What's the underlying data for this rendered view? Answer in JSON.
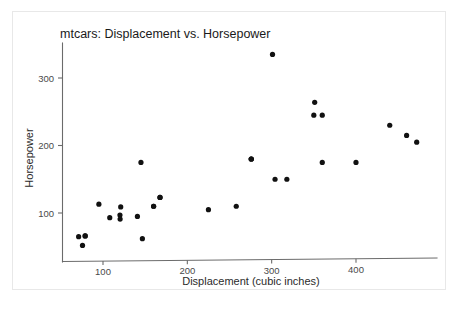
{
  "chart_data": {
    "type": "scatter",
    "title": "mtcars: Displacement vs. Horsepower",
    "xlabel": "Displacement (cubic inches)",
    "ylabel": "Horsepower",
    "xlim": [
      60,
      490
    ],
    "ylim": [
      45,
      350
    ],
    "xticks": [
      100,
      200,
      300,
      400
    ],
    "xtick_labels": [
      "100",
      "200",
      "300",
      "400"
    ],
    "yticks": [
      100,
      200,
      300
    ],
    "ytick_labels": [
      "100",
      "200",
      "300"
    ],
    "grid": false,
    "legend": null,
    "marker": "filled-circle",
    "marker_color": "#111111",
    "points": [
      {
        "x": 160.0,
        "y": 110
      },
      {
        "x": 160.0,
        "y": 110
      },
      {
        "x": 108.0,
        "y": 93
      },
      {
        "x": 258.0,
        "y": 110
      },
      {
        "x": 360.0,
        "y": 175
      },
      {
        "x": 225.0,
        "y": 105
      },
      {
        "x": 360.0,
        "y": 245
      },
      {
        "x": 146.7,
        "y": 62
      },
      {
        "x": 140.8,
        "y": 95
      },
      {
        "x": 167.6,
        "y": 123
      },
      {
        "x": 167.6,
        "y": 123
      },
      {
        "x": 275.8,
        "y": 180
      },
      {
        "x": 275.8,
        "y": 180
      },
      {
        "x": 275.8,
        "y": 180
      },
      {
        "x": 472.0,
        "y": 205
      },
      {
        "x": 460.0,
        "y": 215
      },
      {
        "x": 440.0,
        "y": 230
      },
      {
        "x": 78.7,
        "y": 66
      },
      {
        "x": 75.7,
        "y": 52
      },
      {
        "x": 71.1,
        "y": 65
      },
      {
        "x": 120.1,
        "y": 97
      },
      {
        "x": 318.0,
        "y": 150
      },
      {
        "x": 304.0,
        "y": 150
      },
      {
        "x": 350.0,
        "y": 245
      },
      {
        "x": 400.0,
        "y": 175
      },
      {
        "x": 79.0,
        "y": 66
      },
      {
        "x": 120.3,
        "y": 91
      },
      {
        "x": 95.1,
        "y": 113
      },
      {
        "x": 351.0,
        "y": 264
      },
      {
        "x": 145.0,
        "y": 175
      },
      {
        "x": 301.0,
        "y": 335
      },
      {
        "x": 121.0,
        "y": 109
      }
    ]
  }
}
